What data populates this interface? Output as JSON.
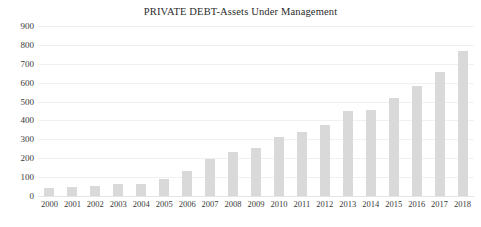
{
  "chart_data": {
    "type": "bar",
    "title": "PRIVATE DEBT-Assets Under Management",
    "xlabel": "",
    "ylabel": "",
    "categories": [
      "2000",
      "2001",
      "2002",
      "2003",
      "2004",
      "2005",
      "2006",
      "2007",
      "2008",
      "2009",
      "2010",
      "2011",
      "2012",
      "2013",
      "2014",
      "2015",
      "2016",
      "2017",
      "2018"
    ],
    "values": [
      40,
      48,
      55,
      62,
      65,
      90,
      130,
      195,
      235,
      255,
      310,
      340,
      375,
      450,
      455,
      520,
      585,
      655,
      770
    ],
    "series": [
      {
        "name": "Assets Under Management",
        "values": [
          40,
          48,
          55,
          62,
          65,
          90,
          130,
          195,
          235,
          255,
          310,
          340,
          375,
          450,
          455,
          520,
          585,
          655,
          770
        ]
      }
    ],
    "ylim": [
      0,
      900
    ],
    "yticks": [
      0,
      100,
      200,
      300,
      400,
      500,
      600,
      700,
      800,
      900
    ],
    "ytick_labels": [
      "0",
      "100",
      "200",
      "300",
      "400",
      "500",
      "600",
      "700",
      "800",
      "900"
    ],
    "grid": true,
    "grid_axis": "y",
    "legend": false,
    "legend_position": "none",
    "bar_color": "#d9d9d9",
    "grid_color": "#f0f0f0",
    "text_color": "#3a3a3a",
    "background": "#ffffff"
  }
}
